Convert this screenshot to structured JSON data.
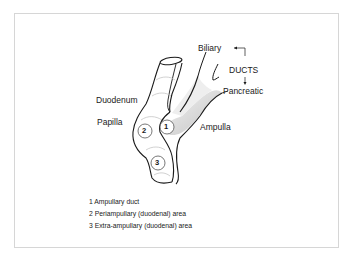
{
  "labels": {
    "biliary": "Biliary",
    "ducts": "DUCTS",
    "pancreatic": "Pancreatic",
    "duodenum": "Duodenum",
    "papilla": "Papilla",
    "ampulla": "Ampulla"
  },
  "markers": [
    {
      "num": "1",
      "name": "ampullary-duct"
    },
    {
      "num": "2",
      "name": "periampullary-area"
    },
    {
      "num": "3",
      "name": "extra-ampullary-area"
    }
  ],
  "legend": [
    {
      "text": "1 Ampullary duct"
    },
    {
      "text": "2 Periampullary (duodenal) area"
    },
    {
      "text": "3 Extra-ampullary (duodenal) area"
    }
  ],
  "colors": {
    "line": "#1a1a1a",
    "shade": "#d9d9d9",
    "frame": "#d6d6d6"
  }
}
